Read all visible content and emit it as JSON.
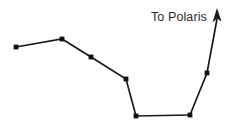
{
  "diagram": {
    "background_color": "#ffffff",
    "line_color": "#1a1a1a",
    "star_color": "#111111",
    "label_color": "#2b2b2b",
    "canvas": {
      "width": 234,
      "height": 133
    },
    "labels": {
      "polaris": "To Polaris"
    },
    "stars": [
      {
        "name": "handle-end-star",
        "x": 16,
        "y": 47,
        "r": 2.6
      },
      {
        "name": "handle-bend-star",
        "x": 62,
        "y": 39,
        "r": 2.6
      },
      {
        "name": "handle-mid-star",
        "x": 91,
        "y": 57,
        "r": 2.6
      },
      {
        "name": "handle-join-star",
        "x": 126,
        "y": 79,
        "r": 2.6
      },
      {
        "name": "bowl-bottom-left-star",
        "x": 136,
        "y": 116,
        "r": 2.6
      },
      {
        "name": "bowl-bottom-right-star",
        "x": 190,
        "y": 115,
        "r": 2.6
      },
      {
        "name": "pointer-star",
        "x": 207,
        "y": 73,
        "r": 2.6
      }
    ],
    "paths": {
      "asterism": "M16,47 L62,39 L91,57 L126,79 L136,116 L190,115",
      "pointer": "M190,115 L207,73 L217,19"
    },
    "arrow_head": {
      "name": "arrow-head-to-polaris",
      "points": "217,8 221.5,21.5 217,18.5 212.5,22.5"
    }
  }
}
